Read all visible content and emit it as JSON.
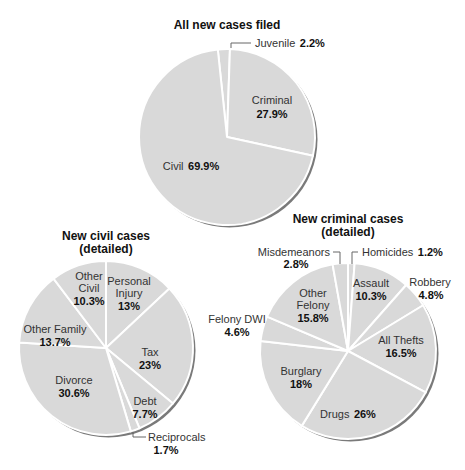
{
  "chart_data": [
    {
      "type": "pie",
      "title": "All new cases filed",
      "center": [
        227,
        137
      ],
      "radius": 88,
      "start_angle_deg": -6,
      "slices": [
        {
          "label": "Juvenile",
          "value": 2.2,
          "display": "2.2%"
        },
        {
          "label": "Criminal",
          "value": 27.9,
          "display": "27.9%"
        },
        {
          "label": "Civil",
          "value": 69.9,
          "display": "69.9%"
        }
      ]
    },
    {
      "type": "pie",
      "title": "New civil cases (detailed)",
      "center": [
        106,
        348
      ],
      "radius": 87,
      "start_angle_deg": 0,
      "slices": [
        {
          "label": "Personal Injury",
          "value": 13,
          "display": "13%"
        },
        {
          "label": "Tax",
          "value": 23,
          "display": "23%"
        },
        {
          "label": "Debt",
          "value": 7.7,
          "display": "7.7%"
        },
        {
          "label": "Reciprocals",
          "value": 1.7,
          "display": "1.7%"
        },
        {
          "label": "Divorce",
          "value": 30.6,
          "display": "30.6%"
        },
        {
          "label": "Other Family",
          "value": 13.7,
          "display": "13.7%"
        },
        {
          "label": "Other Civil",
          "value": 10.3,
          "display": "10.3%"
        }
      ]
    },
    {
      "type": "pie",
      "title": "New criminal cases (detailed)",
      "center": [
        348,
        351
      ],
      "radius": 88,
      "start_angle_deg": 0,
      "slices": [
        {
          "label": "Homicides",
          "value": 1.2,
          "display": "1.2%"
        },
        {
          "label": "Assault",
          "value": 10.3,
          "display": "10.3%"
        },
        {
          "label": "Robbery",
          "value": 4.8,
          "display": "4.8%"
        },
        {
          "label": "All Thefts",
          "value": 16.5,
          "display": "16.5%"
        },
        {
          "label": "Drugs",
          "value": 26,
          "display": "26%"
        },
        {
          "label": "Burglary",
          "value": 18,
          "display": "18%"
        },
        {
          "label": "Felony DWI",
          "value": 4.6,
          "display": "4.6%"
        },
        {
          "label": "Other Felony",
          "value": 15.8,
          "display": "15.8%"
        },
        {
          "label": "Misdemeanors",
          "value": 2.8,
          "display": "2.8%"
        }
      ]
    }
  ],
  "style": {
    "slice_fill": "#d9d9d9",
    "slice_stroke": "#ffffff",
    "shadow": "#7a7a7a"
  }
}
